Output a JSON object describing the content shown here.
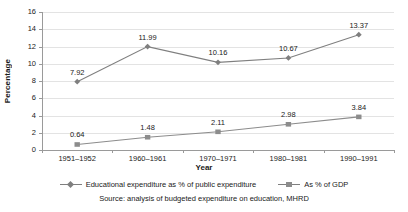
{
  "chart_data": {
    "type": "line",
    "title": "",
    "categories": [
      "1951–1952",
      "1960–1961",
      "1970–1971",
      "1980–1981",
      "1990–1991"
    ],
    "series": [
      {
        "name": "Educational expenditure as % of public expenditure",
        "marker": "diamond",
        "color": "#7f7f7f",
        "values": [
          7.92,
          11.99,
          10.16,
          10.67,
          13.37
        ],
        "labels": [
          "7.92",
          "11.99",
          "10.16",
          "10.67",
          "13.37"
        ]
      },
      {
        "name": "As % of GDP",
        "marker": "square",
        "color": "#8c8c8c",
        "values": [
          0.64,
          1.48,
          2.11,
          2.98,
          3.84
        ],
        "labels": [
          "0.64",
          "1.48",
          "2.11",
          "2.98",
          "3.84"
        ]
      }
    ],
    "xlabel": "Year",
    "ylabel": "Percentage",
    "ylim": [
      0,
      16
    ],
    "yticks": [
      0,
      2,
      4,
      6,
      8,
      10,
      12,
      14,
      16
    ],
    "ytick_labels": [
      "0",
      "2",
      "4",
      "6",
      "8",
      "10",
      "12",
      "14",
      "16"
    ],
    "grid": true,
    "legend_position": "bottom"
  },
  "axes": {
    "y_title": "Percentage",
    "x_title": "Year"
  },
  "legend": {
    "items": [
      {
        "label": "Educational expenditure as % of public expenditure",
        "marker": "diamond"
      },
      {
        "label": "As % of GDP",
        "marker": "square"
      }
    ]
  },
  "footer": {
    "source": "Source: analysis of budgeted expenditure on education, MHRD"
  },
  "colors": {
    "series_1": "#7f7f7f",
    "series_2": "#8c8c8c",
    "grid": "#e3e3e3",
    "axis": "#9a9a9a",
    "text": "#1a1a1a"
  }
}
